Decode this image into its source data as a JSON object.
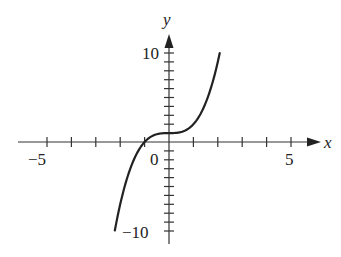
{
  "chart_data": {
    "type": "line",
    "title": "",
    "xlabel": "x",
    "ylabel": "y",
    "xlim": [
      -6.5,
      5.6
    ],
    "ylim": [
      -11,
      12
    ],
    "x_ticks": [
      -5,
      -4,
      -3,
      -2,
      -1,
      0,
      1,
      2,
      3,
      4,
      5
    ],
    "x_tick_labels": [
      {
        "value": -5,
        "label": "−5"
      },
      {
        "value": 0,
        "label": "0"
      },
      {
        "value": 5,
        "label": "5"
      }
    ],
    "y_ticks": [
      -10,
      -9,
      -8,
      -7,
      -6,
      -5,
      -4,
      -3,
      -2,
      -1,
      0,
      1,
      2,
      3,
      4,
      5,
      6,
      7,
      8,
      9,
      10
    ],
    "y_tick_labels": [
      {
        "value": 10,
        "label": "10"
      },
      {
        "value": -10,
        "label": "−10"
      }
    ],
    "grid": false,
    "legend": null,
    "series": [
      {
        "name": "y = x^3 + 1",
        "x": [
          -2.22,
          -2.0,
          -1.75,
          -1.5,
          -1.25,
          -1.0,
          -0.75,
          -0.5,
          -0.25,
          0.0,
          0.25,
          0.5,
          0.75,
          1.0,
          1.25,
          1.5,
          1.75,
          2.0,
          2.08
        ],
        "y": [
          -9.94,
          -7.0,
          -4.36,
          -2.38,
          -0.95,
          0.0,
          0.58,
          0.875,
          0.98,
          1.0,
          1.02,
          1.125,
          1.42,
          2.0,
          2.95,
          4.38,
          6.36,
          9.0,
          10.0
        ]
      }
    ],
    "color": "#222222"
  },
  "labels": {
    "x_axis": "x",
    "y_axis": "y",
    "x_neg5": "−5",
    "x_zero": "0",
    "x_pos5": "5",
    "y_pos10": "10",
    "y_neg10": "−10"
  }
}
